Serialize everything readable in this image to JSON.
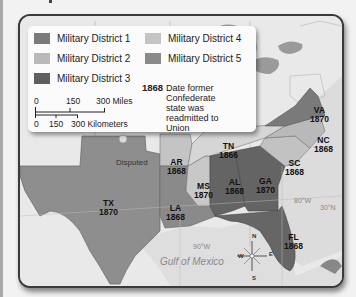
{
  "legend": {
    "districts": [
      {
        "label": "Military District 1",
        "color": "#7a7a7a"
      },
      {
        "label": "Military District 2",
        "color": "#b9b9b9"
      },
      {
        "label": "Military District 3",
        "color": "#5f5f5f"
      },
      {
        "label": "Military District 4",
        "color": "#c4c4c4"
      },
      {
        "label": "Military District 5",
        "color": "#8a8a8a"
      }
    ],
    "date_key": {
      "sample_year": "1868",
      "description": "Date former Confederate state was readmitted to Union"
    },
    "scale": {
      "miles": [
        "0",
        "150",
        "300 Miles"
      ],
      "kilometers": [
        "0",
        "150",
        "300 Kilometers"
      ]
    }
  },
  "map": {
    "states": [
      {
        "abbr": "VA",
        "year": "1870",
        "district": 1
      },
      {
        "abbr": "NC",
        "year": "1868",
        "district": 2
      },
      {
        "abbr": "SC",
        "year": "1868",
        "district": 2
      },
      {
        "abbr": "GA",
        "year": "1870",
        "district": 3
      },
      {
        "abbr": "AL",
        "year": "1868",
        "district": 3
      },
      {
        "abbr": "FL",
        "year": "1868",
        "district": 3
      },
      {
        "abbr": "MS",
        "year": "1870",
        "district": 4
      },
      {
        "abbr": "AR",
        "year": "1868",
        "district": 4
      },
      {
        "abbr": "LA",
        "year": "1868",
        "district": 5
      },
      {
        "abbr": "TX",
        "year": "1870",
        "district": 5
      },
      {
        "abbr": "TN",
        "year": "1866",
        "district": null
      }
    ],
    "annotations": {
      "disputed": "Disputed",
      "gulf": "Gulf of Mexico",
      "lon_80": "80°W",
      "lon_90": "90°W",
      "lat_30": "30°N"
    },
    "compass": {
      "n": "N",
      "s": "S",
      "e": "E",
      "w": "W"
    }
  }
}
